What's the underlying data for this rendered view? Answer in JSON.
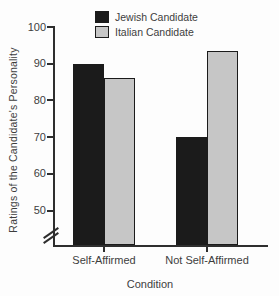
{
  "figure": {
    "background": "#fdfdfd",
    "axis_color": "#2e2e2e",
    "text_color": "#3d3d3d"
  },
  "chart_data": {
    "type": "bar",
    "categories": [
      "Self-Affirmed",
      "Not Self-Affirmed"
    ],
    "series": [
      {
        "name": "Jewish Candidate",
        "color": "#1b1b1b",
        "values": [
          90,
          70
        ]
      },
      {
        "name": "Italian Candidate",
        "color": "#c6c6c6",
        "values": [
          86,
          93.5
        ]
      }
    ],
    "title": "",
    "xlabel": "Condition",
    "ylabel": "Ratings of the Candidate's Personality",
    "yticks": [
      100,
      90,
      80,
      70,
      60,
      50
    ],
    "ylim": [
      50,
      100
    ],
    "axis_break": true,
    "grid": false,
    "legend_position": "top-center"
  }
}
